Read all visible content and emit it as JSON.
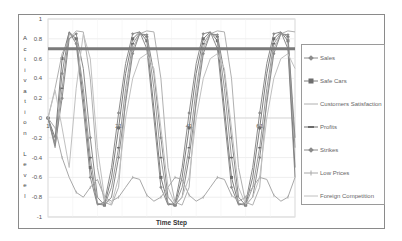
{
  "chart_data": {
    "type": "line",
    "title": "",
    "xlabel": "Time Step",
    "ylabel": "Activation Level",
    "ylim": [
      -1,
      1
    ],
    "xlim": [
      1,
      71
    ],
    "yticks": [
      "1",
      "0.8",
      "0.6",
      "0.4",
      "0.2",
      "0",
      "-0.2",
      "-0.4",
      "-0.6",
      "-0.8",
      "-1"
    ],
    "xticks": [
      "1",
      "21",
      "41",
      "61"
    ],
    "grid": true,
    "legend_position": "right",
    "threshold_line": {
      "value": 0.7,
      "color": "#7a7a7a",
      "width": 3
    },
    "x": [
      1,
      3,
      5,
      7,
      9,
      11,
      13,
      15,
      17,
      19,
      21,
      23,
      25,
      27,
      29,
      31,
      33,
      35,
      37,
      39,
      41,
      43,
      45,
      47,
      49,
      51,
      53,
      55,
      57,
      59,
      61,
      63,
      65,
      67,
      69,
      71
    ],
    "series": [
      {
        "name": "Sales",
        "marker": "diamond",
        "color": "#8c8c8c",
        "values": [
          0,
          -0.25,
          0.45,
          0.87,
          0.75,
          0.1,
          -0.6,
          -0.88,
          -0.85,
          -0.5,
          0.05,
          0.55,
          0.85,
          0.87,
          0.7,
          0.0,
          -0.7,
          -0.88,
          -0.86,
          -0.5,
          0.05,
          0.55,
          0.85,
          0.87,
          0.7,
          0.0,
          -0.7,
          -0.88,
          -0.86,
          -0.5,
          0.05,
          0.55,
          0.85,
          0.87,
          0.7,
          -0.6
        ]
      },
      {
        "name": "Safe Cars",
        "marker": "square",
        "color": "#7d7d7d",
        "values": [
          0,
          -0.2,
          0.6,
          0.87,
          0.8,
          0.2,
          -0.5,
          -0.87,
          -0.88,
          -0.6,
          -0.1,
          0.45,
          0.8,
          0.87,
          0.78,
          0.1,
          -0.6,
          -0.87,
          -0.88,
          -0.6,
          -0.1,
          0.45,
          0.8,
          0.87,
          0.78,
          0.1,
          -0.6,
          -0.87,
          -0.88,
          -0.6,
          -0.1,
          0.45,
          0.8,
          0.87,
          0.78,
          -0.5
        ]
      },
      {
        "name": "Customers Satisfaction",
        "marker": "none",
        "color": "#b0b0b0",
        "values": [
          0,
          0.3,
          0.65,
          0.8,
          0.88,
          0.87,
          0.4,
          -0.5,
          -0.85,
          -0.88,
          -0.7,
          0.2,
          0.7,
          0.85,
          0.88,
          0.87,
          0.4,
          -0.5,
          -0.85,
          -0.88,
          -0.7,
          0.2,
          0.7,
          0.85,
          0.88,
          0.87,
          0.4,
          -0.5,
          -0.85,
          -0.88,
          -0.7,
          0.2,
          0.7,
          0.85,
          0.88,
          0.87
        ]
      },
      {
        "name": "Profits",
        "marker": "line",
        "color": "#9a9a9a",
        "values": [
          0,
          -0.3,
          0.3,
          0.85,
          0.8,
          0.3,
          -0.4,
          -0.86,
          -0.88,
          -0.7,
          -0.3,
          0.3,
          0.75,
          0.86,
          0.82,
          0.3,
          -0.4,
          -0.86,
          -0.88,
          -0.7,
          -0.3,
          0.3,
          0.75,
          0.86,
          0.82,
          0.3,
          -0.4,
          -0.86,
          -0.88,
          -0.7,
          -0.3,
          0.3,
          0.75,
          0.86,
          0.82,
          -0.3
        ]
      },
      {
        "name": "Strikes",
        "marker": "diamond",
        "color": "#8a8a8a",
        "values": [
          0,
          -0.28,
          0.2,
          0.8,
          0.85,
          0.5,
          -0.2,
          -0.8,
          -0.88,
          -0.8,
          -0.4,
          0.15,
          0.65,
          0.85,
          0.84,
          0.45,
          -0.2,
          -0.8,
          -0.88,
          -0.8,
          -0.4,
          0.15,
          0.65,
          0.85,
          0.84,
          0.45,
          -0.2,
          -0.8,
          -0.88,
          -0.8,
          -0.4,
          0.15,
          0.65,
          0.85,
          0.84,
          -0.2
        ]
      },
      {
        "name": "Low Prices",
        "marker": "plus",
        "color": "#a8a8a8",
        "values": [
          0,
          -0.1,
          -0.4,
          -0.6,
          -0.75,
          -0.8,
          -0.7,
          -0.62,
          -0.8,
          -0.84,
          -0.8,
          -0.7,
          -0.6,
          -0.62,
          -0.78,
          -0.84,
          -0.8,
          -0.7,
          -0.6,
          -0.62,
          -0.78,
          -0.84,
          -0.8,
          -0.7,
          -0.6,
          -0.62,
          -0.78,
          -0.84,
          -0.8,
          -0.7,
          -0.6,
          -0.62,
          -0.78,
          -0.84,
          -0.8,
          -0.6
        ]
      },
      {
        "name": "Foreign Competition",
        "marker": "none",
        "color": "#c0c0c0",
        "values": [
          0,
          0.28,
          -0.1,
          -0.5,
          0.3,
          0.85,
          0.6,
          -0.3,
          -0.8,
          -0.87,
          -0.6,
          0.0,
          0.4,
          0.6,
          0.65,
          0.5,
          -0.1,
          -0.7,
          -0.87,
          -0.8,
          -0.6,
          0.0,
          0.4,
          0.6,
          0.65,
          0.5,
          -0.1,
          -0.7,
          -0.87,
          -0.8,
          -0.6,
          0.0,
          0.4,
          0.6,
          0.65,
          0.5
        ]
      }
    ]
  },
  "axis": {
    "ylabel_chars": [
      "A",
      "c",
      "t",
      "i",
      "v",
      "a",
      "t",
      "i",
      "o",
      "n",
      "",
      "L",
      "e",
      "v",
      "e",
      "l"
    ],
    "xlabel": "Time Step"
  },
  "legend": {
    "items": [
      {
        "label": "Sales"
      },
      {
        "label": "Safe Cars"
      },
      {
        "label": "Customers Satisfaction"
      },
      {
        "label": "Profits"
      },
      {
        "label": "Strikes"
      },
      {
        "label": "Low Prices"
      },
      {
        "label": "Foreign Competition"
      }
    ]
  }
}
